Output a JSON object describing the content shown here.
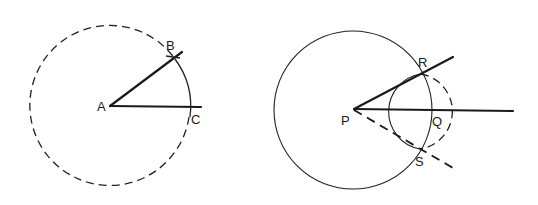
{
  "figure_left": {
    "labels": {
      "A": "A",
      "B": "B",
      "C": "C"
    },
    "description": "Dashed circle centered at A; ray AB and ray AC forming an angle; solid arc from B to C"
  },
  "figure_right": {
    "labels": {
      "P": "P",
      "Q": "Q",
      "R": "R",
      "S": "S"
    },
    "description": "Solid circle centered at P through Q; dashed circle centered at Q; tangent line PR (solid), line PQ (solid), tangent line PS (dashed)"
  }
}
